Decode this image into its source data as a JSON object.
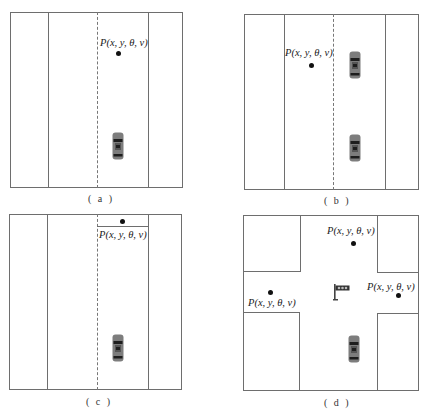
{
  "figure": {
    "panels": [
      {
        "id": "a",
        "caption": "( a )",
        "point_label": "P(x, y, θ, v)",
        "cars": 1,
        "scenario": "single-lane-follow"
      },
      {
        "id": "b",
        "caption": "( b )",
        "point_label": "P(x, y, θ, v)",
        "cars": 2,
        "scenario": "lane-change"
      },
      {
        "id": "c",
        "caption": "( c )",
        "point_label": "P(x, y, θ, v)",
        "cars": 1,
        "scenario": "stop-line"
      },
      {
        "id": "d",
        "caption": "( d )",
        "point_labels": [
          "P(x, y, θ, v)",
          "P(x, y, θ, v)",
          "P(x, y, θ, v)"
        ],
        "cars": 1,
        "scenario": "intersection",
        "has_traffic_light": true
      }
    ]
  },
  "colors": {
    "line": "#6e6e6e",
    "car_body": "#7d7d7d",
    "car_dark": "#1e1e1e",
    "dot": "#111111"
  }
}
